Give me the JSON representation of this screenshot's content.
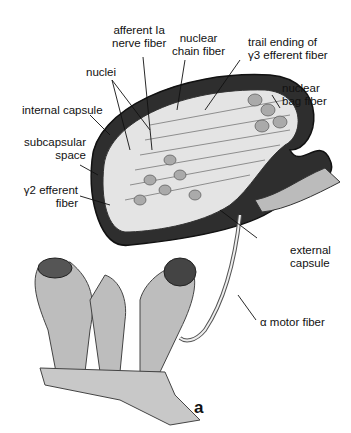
{
  "figure": {
    "panel_label": "a",
    "labels": {
      "afferent": [
        "afferent Ia",
        "nerve fiber"
      ],
      "nuclear_chain": [
        "nuclear",
        "chain fiber"
      ],
      "trail_ending": [
        "trail ending of",
        "γ3 efferent fiber"
      ],
      "nuclei": "nuclei",
      "nuclear_bag": [
        "nuclear",
        "bag fiber"
      ],
      "internal_capsule": "internal capsule",
      "subcapsular": [
        "subcapsular",
        "space"
      ],
      "gamma2": [
        "γ2 efferent",
        "fiber"
      ],
      "external_capsule": [
        "external",
        "capsule"
      ],
      "alpha_motor": "α motor fiber"
    }
  }
}
